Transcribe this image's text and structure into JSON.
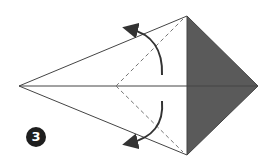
{
  "diagram": {
    "step_number": "3",
    "colors": {
      "paper_front": "#ffffff",
      "paper_back": "#5a5a5a",
      "line": "#444444",
      "arrow": "#333333",
      "step_badge": "#1e1e1e"
    },
    "shapes": {
      "kite_outline": "left point, top point, right point, bottom point",
      "valley_folds": "two dashed diagonal lines from center-left to top and bottom corners",
      "arrows": [
        "fold top flap up-left",
        "fold bottom flap down-left"
      ]
    }
  }
}
